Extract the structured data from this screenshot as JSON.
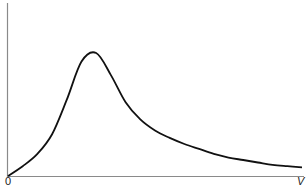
{
  "chart_data": {
    "type": "line",
    "title": "",
    "xlabel": "V",
    "ylabel": "",
    "origin_label": "0",
    "grid": false,
    "legend": null,
    "x": [
      0,
      0.05,
      0.1,
      0.15,
      0.2,
      0.25,
      0.3,
      0.35,
      0.4,
      0.45,
      0.5,
      0.55,
      0.6,
      0.65,
      0.7,
      0.75,
      0.8,
      0.85,
      0.9,
      0.95,
      1.0
    ],
    "series": [
      {
        "name": "distribution",
        "values": [
          0.0,
          0.08,
          0.18,
          0.34,
          0.62,
          0.93,
          1.0,
          0.82,
          0.6,
          0.46,
          0.37,
          0.31,
          0.26,
          0.22,
          0.18,
          0.15,
          0.13,
          0.11,
          0.09,
          0.08,
          0.07
        ]
      }
    ],
    "xlim": [
      0,
      1
    ],
    "ylim": [
      0,
      1.1
    ],
    "color": "#111111"
  }
}
